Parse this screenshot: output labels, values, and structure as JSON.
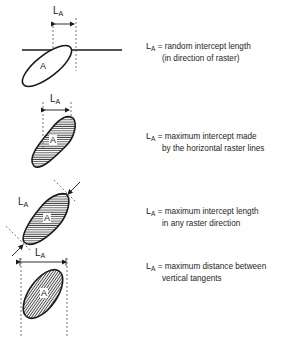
{
  "figure": {
    "symbol": "L",
    "subscript": "A",
    "region_label": "A",
    "colors": {
      "ink": "#1a1a1a",
      "background": "#ffffff",
      "dash": "#555555"
    }
  },
  "panels": [
    {
      "id": "random",
      "eq": "=",
      "line1": "random intercept length",
      "line2": "(in direction of raster)"
    },
    {
      "id": "horizontal",
      "eq": "=",
      "line1": "maximum intercept made",
      "line2": "by the horizontal raster lines"
    },
    {
      "id": "any-direction",
      "eq": "=",
      "line1": "maximum intercept length",
      "line2": "in any raster direction"
    },
    {
      "id": "vertical-tangents",
      "eq": "=",
      "line1": "maximum distance between",
      "line2": "vertical tangents"
    }
  ]
}
